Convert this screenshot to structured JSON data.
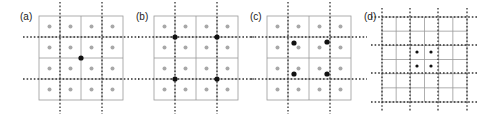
{
  "colors": {
    "grid": "#9a9a9a",
    "dotted": "#333333",
    "gray_dot": "#a8a8a8",
    "black_dot": "#111111",
    "background": "#ffffff"
  },
  "panels": [
    {
      "label": "(a)",
      "label_pos": [
        20,
        20
      ],
      "grid": {
        "x": 39,
        "y": 16,
        "size": 84,
        "cells": 4
      },
      "gray_dots": true,
      "dotted_v": [
        60,
        102
      ],
      "dotted_h": [
        37,
        79
      ],
      "dotted_ext": 10,
      "black_dots": [
        [
          81,
          58
        ]
      ],
      "black_r": 2.6
    },
    {
      "label": "(b)",
      "label_pos": [
        136,
        20
      ],
      "grid": {
        "x": 154,
        "y": 16,
        "size": 84,
        "cells": 4
      },
      "gray_dots": true,
      "dotted_v": [
        175,
        217
      ],
      "dotted_h": [
        37,
        79
      ],
      "dotted_ext": 10,
      "black_dots": [
        [
          175,
          37
        ],
        [
          217,
          37
        ],
        [
          175,
          79
        ],
        [
          217,
          79
        ]
      ],
      "black_r": 2.6
    },
    {
      "label": "(c)",
      "label_pos": [
        250,
        20
      ],
      "grid": {
        "x": 267,
        "y": 16,
        "size": 84,
        "cells": 4
      },
      "gray_dots": true,
      "dotted_v": [
        288,
        330
      ],
      "dotted_h": [
        37,
        79
      ],
      "dotted_ext": 10,
      "black_dots": [
        [
          294,
          43
        ],
        [
          327,
          42
        ],
        [
          294,
          74
        ],
        [
          327,
          74
        ]
      ],
      "black_r": 2.6
    },
    {
      "label": "(d)",
      "label_pos": [
        364,
        20
      ],
      "grid": {
        "x": 382,
        "y": 17,
        "size": 85,
        "cells": 6
      },
      "gray_dots": false,
      "dotted_v": [
        382,
        410,
        438,
        467
      ],
      "dotted_h": [
        17,
        45,
        73,
        102
      ],
      "dotted_ext": 5,
      "black_dots": [
        [
          417,
          52
        ],
        [
          431,
          52
        ],
        [
          417,
          66
        ],
        [
          431,
          66
        ]
      ],
      "black_r": 1.6
    }
  ]
}
